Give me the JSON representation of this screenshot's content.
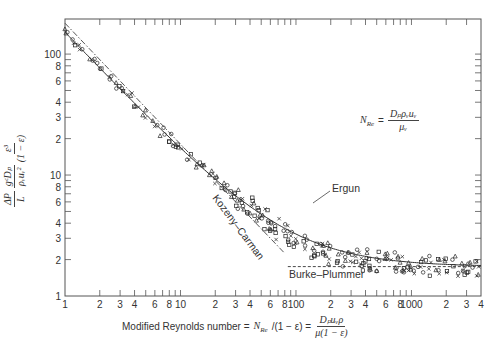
{
  "chart_data": {
    "type": "scatter",
    "title": "",
    "xlabel": "Modified Reynolds number = N_Re/(1 − ε) = D_p u_V ρ / μ(1 − ε)",
    "ylabel": "(ΔP/L)(g_c D_p / ρ u_V²)(ε³/(1 − ε))",
    "xscale": "log",
    "yscale": "log",
    "xlim": [
      1,
      4000
    ],
    "ylim": [
      1,
      195
    ],
    "grid": false,
    "x_ticks": [
      1,
      2,
      3,
      4,
      5,
      6,
      7,
      8,
      9,
      10,
      20,
      30,
      40,
      50,
      60,
      70,
      80,
      90,
      100,
      200,
      300,
      400,
      500,
      600,
      700,
      800,
      900,
      1000,
      2000,
      3000,
      4000
    ],
    "x_tick_labels": [
      {
        "v": 1,
        "t": "1"
      },
      {
        "v": 2,
        "t": "2"
      },
      {
        "v": 3,
        "t": "3"
      },
      {
        "v": 4,
        "t": "4"
      },
      {
        "v": 6,
        "t": "6"
      },
      {
        "v": 8,
        "t": "8"
      },
      {
        "v": 10,
        "t": "10"
      },
      {
        "v": 20,
        "t": "2"
      },
      {
        "v": 30,
        "t": "3"
      },
      {
        "v": 40,
        "t": "4"
      },
      {
        "v": 60,
        "t": "6"
      },
      {
        "v": 80,
        "t": "8"
      },
      {
        "v": 100,
        "t": "100"
      },
      {
        "v": 200,
        "t": "2"
      },
      {
        "v": 300,
        "t": "3"
      },
      {
        "v": 400,
        "t": "4"
      },
      {
        "v": 600,
        "t": "6"
      },
      {
        "v": 800,
        "t": "8"
      },
      {
        "v": 1000,
        "t": "1000"
      },
      {
        "v": 2000,
        "t": "2"
      },
      {
        "v": 3000,
        "t": "3"
      },
      {
        "v": 4000,
        "t": "4"
      }
    ],
    "y_ticks": [
      1,
      2,
      3,
      4,
      5,
      6,
      7,
      8,
      9,
      10,
      20,
      30,
      40,
      50,
      60,
      70,
      80,
      90,
      100
    ],
    "y_tick_labels": [
      {
        "v": 1,
        "t": "1"
      },
      {
        "v": 2,
        "t": "2"
      },
      {
        "v": 3,
        "t": "3"
      },
      {
        "v": 4,
        "t": "4"
      },
      {
        "v": 6,
        "t": "6"
      },
      {
        "v": 8,
        "t": "8"
      },
      {
        "v": 10,
        "t": "10"
      },
      {
        "v": 20,
        "t": "2"
      },
      {
        "v": 30,
        "t": "3"
      },
      {
        "v": 40,
        "t": "4"
      },
      {
        "v": 60,
        "t": "6"
      },
      {
        "v": 80,
        "t": "8"
      },
      {
        "v": 100,
        "t": "100"
      }
    ],
    "series": [
      {
        "name": "Ergun",
        "style": "solid",
        "equation": "150/Re + 1.75",
        "x_range": [
          1,
          4000
        ]
      },
      {
        "name": "Kozeny–Carman",
        "style": "dash-dot",
        "equation": "180/Re",
        "x_range": [
          1,
          80
        ]
      },
      {
        "name": "Burke–Plummer",
        "style": "dashed",
        "equation": "1.75",
        "x_range": [
          85,
          4000
        ]
      },
      {
        "name": "Experimental data",
        "style": "markers",
        "markers": [
          "circle",
          "square",
          "triangle",
          "x"
        ],
        "x": [
          1.05,
          1.2,
          1.4,
          1.7,
          2.0,
          2.4,
          2.8,
          3.2,
          3.6,
          4.2,
          5,
          6,
          7,
          8,
          9,
          10,
          12,
          14,
          16,
          18,
          20,
          24,
          28,
          32,
          36,
          40,
          45,
          50,
          55,
          60,
          70,
          80,
          90,
          100,
          120,
          140,
          160,
          180,
          200,
          240,
          280,
          320,
          360,
          400,
          450,
          500,
          600,
          700,
          800,
          900,
          1000,
          1200,
          1400,
          1700,
          2000,
          2400,
          2800,
          3200,
          3600
        ],
        "y": [
          150,
          128,
          110,
          92,
          78,
          66,
          56,
          50,
          44,
          38,
          32,
          27,
          23,
          20.5,
          18.5,
          17,
          14.5,
          12.6,
          11.2,
          10,
          9.2,
          8,
          7,
          6.4,
          5.8,
          5.4,
          4.9,
          4.6,
          4.3,
          4.0,
          3.6,
          3.3,
          3.1,
          2.95,
          2.7,
          2.55,
          2.4,
          2.3,
          2.25,
          2.15,
          2.1,
          2.05,
          2.0,
          1.98,
          1.95,
          1.92,
          1.9,
          1.88,
          1.86,
          1.84,
          1.82,
          1.8,
          1.79,
          1.78,
          1.78,
          1.77,
          1.77,
          1.76,
          1.76
        ]
      }
    ],
    "annotations": [
      {
        "text": "Ergun",
        "x": 130,
        "y": 3.2
      },
      {
        "text": "Kozeny–Carman",
        "x": 30,
        "y": 3.5,
        "rotation": -52
      },
      {
        "text": "Burke–Plummer",
        "x": 200,
        "y": 1.55
      },
      {
        "text": "N_Re = D_p ρ_V u_V / μ_V",
        "position": "upper-right"
      }
    ]
  },
  "labels": {
    "ergun": "Ergun",
    "kozeny": "Kozeny–Carman",
    "burke": "Burke–Plummer",
    "xlabel_text": "Modified Reynolds number = ",
    "xlabel_nre": "N",
    "xlabel_nre_sub": "Re",
    "xlabel_tail": "/(1 − ε) =",
    "xlabel_frac_num": "Dₚuᵥρ",
    "xlabel_frac_den": "μ(1 − ε)",
    "formula_lhs": "N",
    "formula_lhs_sub": "Re",
    "formula_eq": "=",
    "formula_num": "Dₚρᵥuᵥ",
    "formula_den": "μᵥ",
    "ylabel_f1_num": "ΔP",
    "ylabel_f1_den": "L",
    "ylabel_f2_num": "gᶜDₚ",
    "ylabel_f2_den": "ρᵥuᵥ²",
    "ylabel_f3_num": "ε³",
    "ylabel_f3_den": "(1 − ε)"
  }
}
